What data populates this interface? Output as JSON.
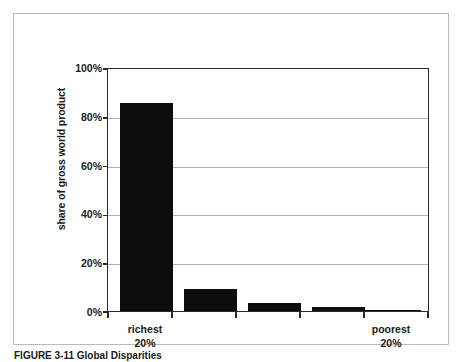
{
  "figure": {
    "caption": "FIGURE 3-11 Global Disparities"
  },
  "chart_data": {
    "type": "bar",
    "title": "",
    "subtitle": "",
    "xlabel": "",
    "ylabel": "share of gross world product",
    "ylim": [
      0,
      100
    ],
    "ytick_labels": [
      "100%",
      "80%",
      "60%",
      "40%",
      "20%",
      "0%"
    ],
    "ytick_values": [
      100,
      80,
      60,
      40,
      20,
      0
    ],
    "grid": true,
    "legend": false,
    "legend_position": "none",
    "categories": [
      "richest 20%",
      "",
      "",
      "",
      "poorest 20%"
    ],
    "category_labels": [
      {
        "line1": "richest",
        "line2": "20%"
      },
      {
        "line1": "",
        "line2": ""
      },
      {
        "line1": "",
        "line2": ""
      },
      {
        "line1": "",
        "line2": ""
      },
      {
        "line1": "poorest",
        "line2": "20%"
      }
    ],
    "values": [
      86,
      9,
      3.5,
      1.5,
      0.5
    ],
    "value_unit": "%",
    "bar_color": "#0d0d0d",
    "gridline_color": "#b0b0b0",
    "axis_color": "#2b2b2b",
    "frame_color": "#b9babc",
    "background_color": "#ffffff"
  }
}
